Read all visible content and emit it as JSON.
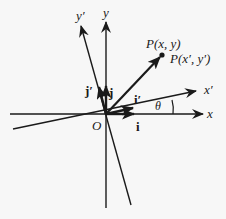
{
  "diagram": {
    "colors": {
      "ink": "#1a1a1a",
      "background": "#f7f7f7"
    },
    "labels": {
      "x_axis": "x",
      "y_axis": "y",
      "x_prime_axis": "x′",
      "y_prime_axis": "y′",
      "origin": "O",
      "point_xy": "P(x, y)",
      "point_xpyp": "P(x′, y′)",
      "unit_i": "i",
      "unit_j": "j",
      "unit_i_prime": "i′",
      "unit_j_prime": "j′",
      "angle": "θ"
    }
  }
}
